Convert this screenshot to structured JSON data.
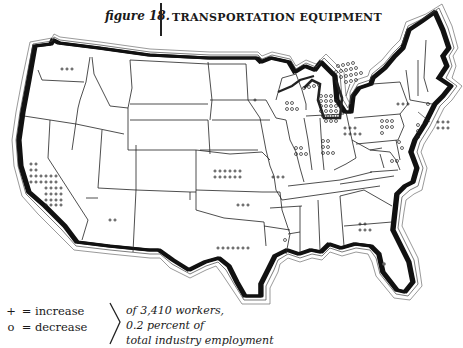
{
  "header": {
    "figure_label": "figure 18.",
    "title": "TRANSPORTATION EQUIPMENT"
  },
  "legend": {
    "increase_symbol": "+",
    "increase_label": "= increase",
    "decrease_symbol": "o",
    "decrease_label": "= decrease",
    "note_line1": "of 3,410 workers,",
    "note_line2": "0.2 percent of",
    "note_line3": "total industry employment"
  },
  "map": {
    "type": "dot-symbol map of United States",
    "symbol_unit": "each symbol represents a share of 3,410 workers",
    "states": [
      {
        "state": "Washington",
        "symbol": "+",
        "count": 3
      },
      {
        "state": "California",
        "symbol": "+",
        "count": 32
      },
      {
        "state": "Arizona",
        "symbol": "+",
        "count": 2
      },
      {
        "state": "Kansas",
        "symbol": "+",
        "count": 12
      },
      {
        "state": "Oklahoma",
        "symbol": "+",
        "count": 3
      },
      {
        "state": "Texas",
        "symbol": "+",
        "count": 7
      },
      {
        "state": "Missouri",
        "symbol": "+",
        "count": 3
      },
      {
        "state": "Minnesota",
        "symbol": "+",
        "count": 1
      },
      {
        "state": "Louisiana",
        "symbol": "o",
        "count": 1
      },
      {
        "state": "Georgia",
        "symbol": "+",
        "count": 5
      },
      {
        "state": "Florida",
        "symbol": "o",
        "count": 1
      },
      {
        "state": "Wisconsin",
        "symbol": "o",
        "count": 5
      },
      {
        "state": "Michigan",
        "symbol": "o",
        "count": 30
      },
      {
        "state": "Michigan Upper Peninsula / Ontario callout",
        "symbol": "o",
        "count": 17
      },
      {
        "state": "Illinois",
        "symbol": "o",
        "count": 6
      },
      {
        "state": "Indiana",
        "symbol": "o",
        "count": 7
      },
      {
        "state": "Ohio",
        "symbol": "+",
        "count": 7
      },
      {
        "state": "Pennsylvania",
        "symbol": "o",
        "count": 7
      },
      {
        "state": "New York",
        "symbol": "+",
        "count": 3
      },
      {
        "state": "New Jersey",
        "symbol": "o",
        "count": 3
      },
      {
        "state": "Maryland",
        "symbol": "o",
        "count": 2
      },
      {
        "state": "Virginia",
        "symbol": "o",
        "count": 2
      },
      {
        "state": "Connecticut",
        "symbol": "o",
        "count": 1
      },
      {
        "state": "New England (callout)",
        "symbol": "+",
        "count": 6
      }
    ]
  }
}
